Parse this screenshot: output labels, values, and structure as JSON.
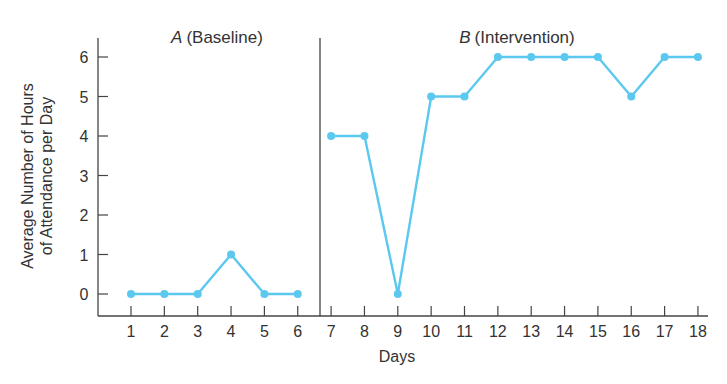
{
  "chart_data": {
    "type": "line",
    "title": "",
    "xlabel": "Days",
    "ylabel": [
      "Average Number of Hours",
      "of Attendance per Day"
    ],
    "x": [
      1,
      2,
      3,
      4,
      5,
      6,
      7,
      8,
      9,
      10,
      11,
      12,
      13,
      14,
      15,
      16,
      17,
      18
    ],
    "x_tick_labels": [
      "1",
      "2",
      "3",
      "4",
      "5",
      "6",
      "7",
      "8",
      "9",
      "10",
      "11",
      "12",
      "13",
      "14",
      "15",
      "16",
      "17",
      "18"
    ],
    "y_tick_labels": [
      "0",
      "1",
      "2",
      "3",
      "4",
      "5",
      "6"
    ],
    "ylim": [
      -0.5,
      6.5
    ],
    "xlim": [
      0,
      18.4
    ],
    "grid": false,
    "legend": "none",
    "line_color": "#5bc8ef",
    "phases": [
      {
        "name": "A",
        "label": "(Baseline)",
        "days": [
          1,
          2,
          3,
          4,
          5,
          6
        ],
        "values": [
          0,
          0,
          0,
          1,
          0,
          0
        ]
      },
      {
        "name": "B",
        "label": "(Intervention)",
        "days": [
          7,
          8,
          9,
          10,
          11,
          12,
          13,
          14,
          15,
          16,
          17,
          18
        ],
        "values": [
          4,
          4,
          0,
          5,
          5,
          6,
          6,
          6,
          6,
          5,
          6,
          6
        ]
      }
    ],
    "phase_change_after_day": 6
  }
}
